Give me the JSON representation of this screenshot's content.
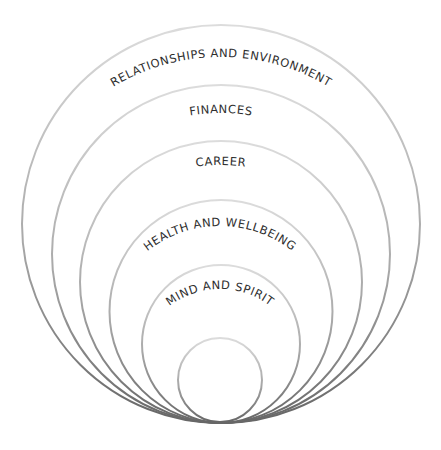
{
  "diagram": {
    "type": "nested-circles",
    "colors": {
      "ring_light": "#d4d4d4",
      "ring_dark": "#6e6e6e",
      "label": "#2e2e2e",
      "background": "#ffffff"
    },
    "layers": [
      {
        "label": "RELATIONSHIPS AND ENVIRONMENT",
        "level": 1
      },
      {
        "label": "FINANCES",
        "level": 2
      },
      {
        "label": "CAREER",
        "level": 3
      },
      {
        "label": "HEALTH AND WELLBEING",
        "level": 4
      },
      {
        "label": "MIND AND SPIRIT",
        "level": 5
      },
      {
        "label": "",
        "level": 6
      }
    ]
  }
}
